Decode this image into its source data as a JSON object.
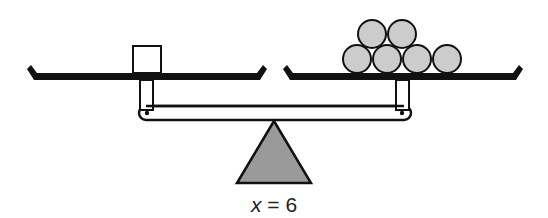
{
  "diagram": {
    "type": "balance-scale",
    "left_pan": {
      "objects": [
        {
          "shape": "square",
          "count": 1,
          "fill": "#ffffff",
          "represents": "x"
        }
      ]
    },
    "right_pan": {
      "objects": [
        {
          "shape": "circle",
          "count": 6,
          "fill": "#cccccc",
          "rows": [
            2,
            4
          ]
        }
      ]
    },
    "fulcrum": {
      "shape": "triangle",
      "fill": "#999999"
    },
    "colors": {
      "stroke": "#111111",
      "ball_fill": "#cccccc",
      "fulcrum_fill": "#9a9a9a",
      "background": "#ffffff"
    }
  },
  "caption": {
    "variable": "x",
    "equals": " = ",
    "value": "6"
  }
}
